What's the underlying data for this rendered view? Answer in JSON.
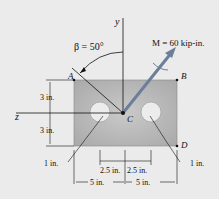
{
  "figure": {
    "moment_label": "M = 60 kip-in.",
    "angle_label": "β = 50°",
    "axis_y": "y",
    "axis_z": "z",
    "points": {
      "A": "A",
      "B": "B",
      "C": "C",
      "D": "D"
    },
    "dims": {
      "top_half": "3 in.",
      "bottom_half": "3 in.",
      "hole_left_radius": "1 in.",
      "hole_right_radius": "1 in.",
      "hole_offset_left": "2.5 in.",
      "hole_offset_right": "2.5 in.",
      "half_width_left": "5 in.",
      "half_width_right": "5 in."
    },
    "colors": {
      "background": "#ebebeb",
      "plate": "#bdbdbd",
      "arrow": "#6b7f99"
    }
  }
}
